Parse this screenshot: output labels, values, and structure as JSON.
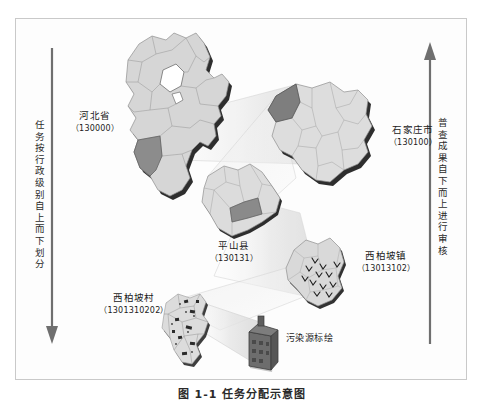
{
  "figure": {
    "caption": "图 1-1  任务分配示意图"
  },
  "axes": {
    "left": {
      "text": "任务按行政级别自上而下划分",
      "direction": "down",
      "arrow_color": "#6f6f6f"
    },
    "right": {
      "text": "普查成果自下而上进行审核",
      "direction": "up",
      "arrow_color": "#6f6f6f"
    }
  },
  "levels": [
    {
      "id": "province",
      "name": "河北省",
      "code": "（130000）"
    },
    {
      "id": "city",
      "name": "石家庄市",
      "code": "（130100）"
    },
    {
      "id": "county",
      "name": "平山县",
      "code": "（130131）"
    },
    {
      "id": "town",
      "name": "西柏坡镇",
      "code": "（13013102）"
    },
    {
      "id": "village",
      "name": "西柏坡村",
      "code": "（1301310202）"
    }
  ],
  "pollution": {
    "label": "污染源标绘"
  },
  "colors": {
    "map_fill": "#d3d3d3",
    "map_fill_light": "#dcdcdc",
    "map_highlight": "#8f8f8f",
    "map_outline": "#8a8a8a",
    "map_shadow": "#1c1c1c",
    "cone_fill": "#e9e9e9",
    "cone_stroke": "#cfcfcf",
    "building_fill": "#6d6d6d",
    "frame": "#c9c9c9",
    "text": "#1b1b1b"
  }
}
